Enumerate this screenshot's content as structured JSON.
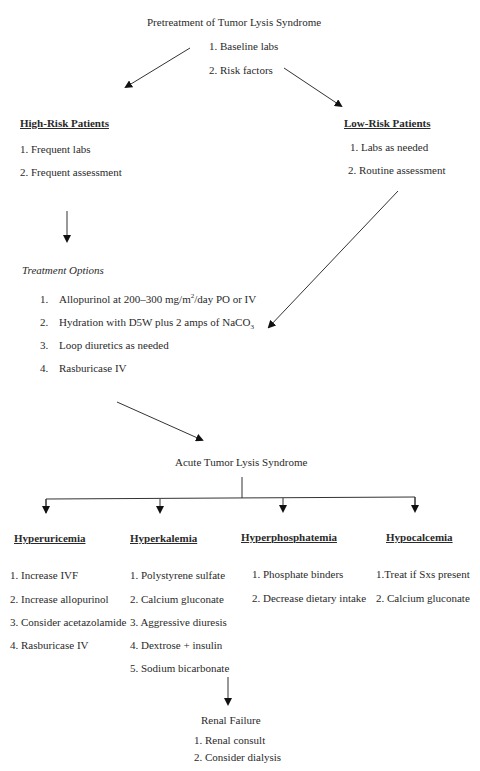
{
  "pretreatment": {
    "title": "Pretreatment of Tumor Lysis Syndrome",
    "items": [
      "1. Baseline labs",
      "2. Risk factors"
    ]
  },
  "high_risk": {
    "title": "High-Risk Patients",
    "items": [
      "1. Frequent labs",
      "2. Frequent assessment"
    ]
  },
  "low_risk": {
    "title": "Low-Risk Patients",
    "items": [
      "1. Labs as needed",
      "2. Routine assessment"
    ]
  },
  "treatment_options": {
    "title": "Treatment Options",
    "items": [
      {
        "num": "1.",
        "pre": "Allopurinol at 200–300 mg/m",
        "sup": "2",
        "post": "/day PO or IV"
      },
      {
        "num": "2.",
        "pre": "Hydration with D5W plus 2 amps of NaCO",
        "sub": "3",
        "post": ""
      },
      {
        "num": "3.",
        "pre": "Loop diuretics as needed"
      },
      {
        "num": "4.",
        "pre": "Rasburicase IV"
      }
    ]
  },
  "acute": {
    "title": "Acute Tumor Lysis Syndrome"
  },
  "branches": [
    {
      "title": "Hyperuricemia",
      "items": [
        "1. Increase IVF",
        "2. Increase allopurinol",
        "3. Consider acetazolamide",
        "4. Rasburicase IV"
      ]
    },
    {
      "title": "Hyperkalemia",
      "items": [
        "1. Polystyrene sulfate",
        "2. Calcium gluconate",
        "3. Aggressive diuresis",
        "4. Dextrose + insulin",
        "5. Sodium bicarbonate"
      ]
    },
    {
      "title": "Hyperphosphatemia",
      "items": [
        "1. Phosphate binders",
        "2. Decrease dietary intake"
      ]
    },
    {
      "title": "Hypocalcemia",
      "items": [
        "1.Treat if Sxs present",
        "2. Calcium gluconate"
      ]
    }
  ],
  "renal_failure": {
    "title": "Renal Failure",
    "items": [
      "1. Renal consult",
      "2. Consider dialysis"
    ]
  }
}
